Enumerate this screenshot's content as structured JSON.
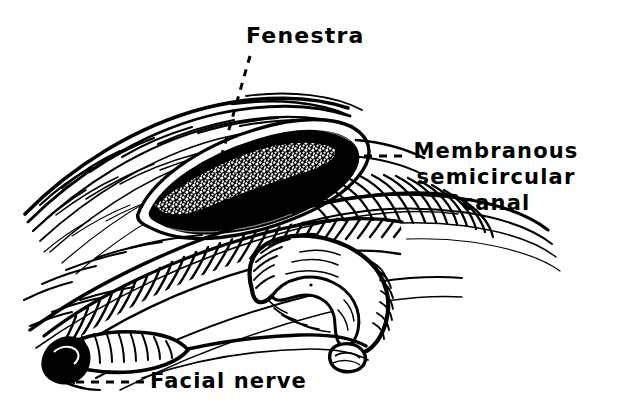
{
  "figure": {
    "kind": "anatomical-line-drawing",
    "background_color": "#ffffff",
    "ink_color": "#000000",
    "labels": {
      "fenestra": "Fenestra",
      "membranous_line1": "Membranous",
      "membranous_line2": "semicircular",
      "membranous_line3": "canal",
      "facial_nerve": "Facial nerve"
    },
    "leaders": {
      "fenestra_style": "dashed-diagonal",
      "membranous_style": "dashed-horizontal",
      "facial_style": "dashed-horizontal"
    },
    "structures": {
      "fenestra_opening": "black-oval-window",
      "membranous_canal_in_window": "stippled-band",
      "semicircular_canal_loop": "hatched-tube-loop",
      "facial_nerve_stump": "cut-tube-end",
      "bone_surface": "curved-line-hatching"
    }
  }
}
